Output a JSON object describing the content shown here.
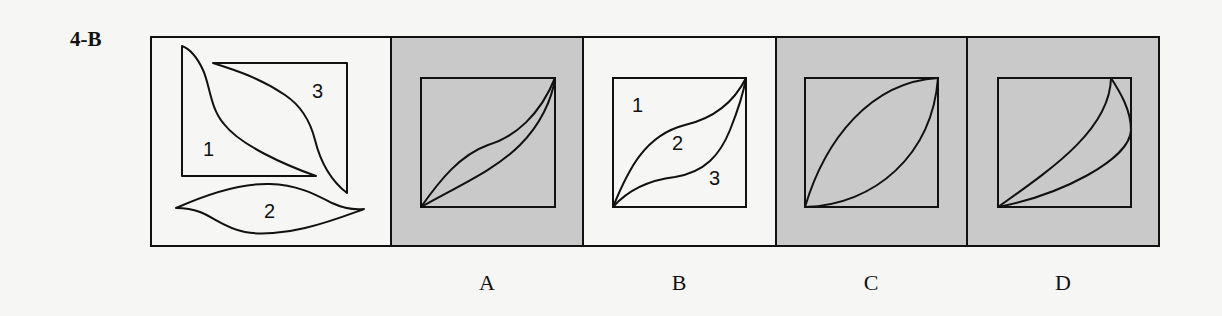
{
  "problem": {
    "label": "4-B"
  },
  "colors": {
    "background": "#f6f6f4",
    "shaded_panel": "#c9c9c9",
    "plain_panel": "#f6f6f4",
    "stroke": "#111111"
  },
  "question_panel": {
    "pieces": [
      {
        "id": "piece-1",
        "number": "1"
      },
      {
        "id": "piece-2",
        "number": "2"
      },
      {
        "id": "piece-3",
        "number": "3"
      }
    ]
  },
  "options": [
    {
      "letter": "A",
      "shaded": true,
      "numbers": []
    },
    {
      "letter": "B",
      "shaded": false,
      "numbers": [
        "1",
        "2",
        "3"
      ]
    },
    {
      "letter": "C",
      "shaded": true,
      "numbers": []
    },
    {
      "letter": "D",
      "shaded": true,
      "numbers": []
    }
  ]
}
